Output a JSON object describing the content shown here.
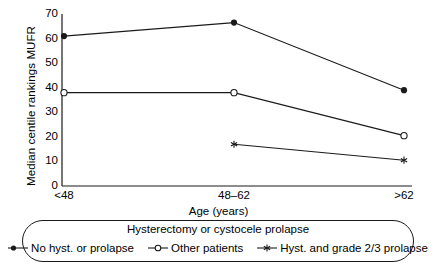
{
  "chart_data": {
    "type": "line",
    "title": "",
    "xlabel": "Age (years)",
    "ylabel": "Median centile rankings MUFR",
    "categories": [
      "<48",
      "48–62",
      ">62"
    ],
    "yticks": [
      0,
      10,
      20,
      30,
      40,
      50,
      60,
      70
    ],
    "ylim": [
      0,
      70
    ],
    "grid": false,
    "legend_position": "bottom",
    "legend_title": "Hysterectomy or cystocele prolapse",
    "series": [
      {
        "name": "No hyst. or prolapse",
        "marker": "filled-circle",
        "values": [
          61,
          66.5,
          39
        ]
      },
      {
        "name": "Other patients",
        "marker": "open-circle",
        "values": [
          38,
          38,
          20.5
        ]
      },
      {
        "name": "Hyst. and grade 2/3 prolapse",
        "marker": "star",
        "values": [
          null,
          17,
          10.5
        ]
      }
    ]
  },
  "axis": {
    "ylabel": "Median centile rankings MUFR",
    "xlabel": "Age (years)",
    "ytick_labels": [
      "70",
      "60",
      "50",
      "40",
      "30",
      "20",
      "10",
      "0"
    ],
    "xtick_labels": [
      "<48",
      "48–62",
      ">62"
    ]
  },
  "legend": {
    "title": "Hysterectomy or cystocele prolapse",
    "items": [
      {
        "label": "No hyst. or prolapse",
        "icon": "filled-circle-line-marker"
      },
      {
        "label": "Other patients",
        "icon": "open-circle-line-marker"
      },
      {
        "label": "Hyst. and grade 2/3 prolapse",
        "icon": "star-line-marker"
      }
    ]
  },
  "colors": {
    "ink": "#1a1a1a",
    "background": "#ffffff"
  }
}
